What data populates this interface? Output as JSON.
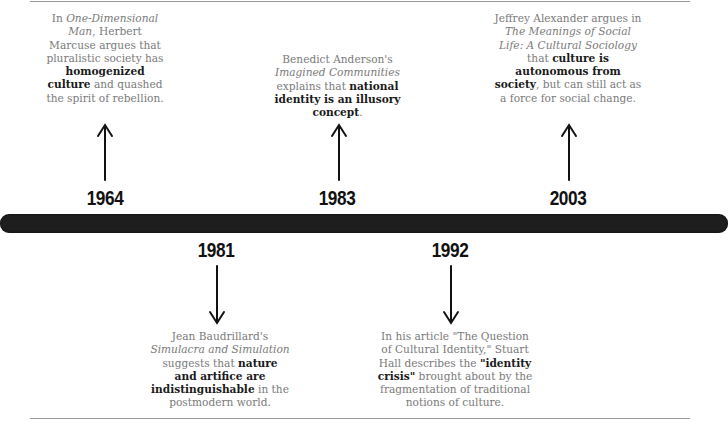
{
  "timeline": {
    "events": [
      {
        "year": "1964",
        "position": "above",
        "text_parts": [
          {
            "t": "In ",
            "s": "n"
          },
          {
            "t": "One-Dimensional Man",
            "s": "i"
          },
          {
            "t": ", Herbert Marcuse argues that pluralistic society has ",
            "s": "n"
          },
          {
            "t": "homogenized culture",
            "s": "b"
          },
          {
            "t": " and quashed the spirit of rebellion.",
            "s": "n"
          }
        ]
      },
      {
        "year": "1981",
        "position": "below",
        "text_parts": [
          {
            "t": "Jean Baudrillard's ",
            "s": "n"
          },
          {
            "t": "Simulacra and Simulation",
            "s": "i"
          },
          {
            "t": " suggests that ",
            "s": "n"
          },
          {
            "t": "nature and artifice are indistinguishable",
            "s": "b"
          },
          {
            "t": " in the postmodern world.",
            "s": "n"
          }
        ]
      },
      {
        "year": "1983",
        "position": "above",
        "text_parts": [
          {
            "t": "Benedict Anderson's ",
            "s": "n"
          },
          {
            "t": "Imagined Communities",
            "s": "i"
          },
          {
            "t": " explains that ",
            "s": "n"
          },
          {
            "t": "national identity is an illusory concept",
            "s": "b"
          },
          {
            "t": ".",
            "s": "n"
          }
        ]
      },
      {
        "year": "1992",
        "position": "below",
        "text_parts": [
          {
            "t": "In his article \"The Question of Cultural Identity,\" Stuart Hall describes the ",
            "s": "n"
          },
          {
            "t": "\"identity crisis\"",
            "s": "b"
          },
          {
            "t": " brought about by the fragmentation of traditional notions of culture.",
            "s": "n"
          }
        ]
      },
      {
        "year": "2003",
        "position": "above",
        "text_parts": [
          {
            "t": "Jeffrey Alexander argues in ",
            "s": "n"
          },
          {
            "t": "The Meanings of Social Life: A Cultural Sociology",
            "s": "i"
          },
          {
            "t": " that ",
            "s": "n"
          },
          {
            "t": "culture is autonomous from society",
            "s": "b"
          },
          {
            "t": ", but can still act as a force for social change.",
            "s": "n"
          }
        ]
      }
    ]
  },
  "colors": {
    "bar": "#1e1e1e",
    "year": "#111111",
    "body_text": "#7a7a7a",
    "emphasis_text": "#1a1a1a",
    "rule": "#9a9a9a"
  }
}
